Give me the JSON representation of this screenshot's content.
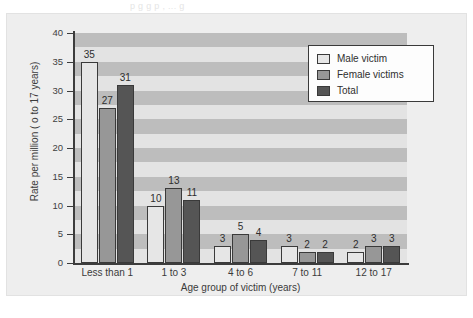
{
  "page": {
    "top_text_fragment": "p      g  g   p                 , ...  g",
    "background_color": "#eeeeee",
    "panel_color": "#eeeeee"
  },
  "chart_data": {
    "type": "bar",
    "title": "",
    "xlabel": "Age group of victim (years)",
    "ylabel": "Rate per million ( o to 17 years)",
    "categories": [
      "Less than 1",
      "1 to 3",
      "4 to 6",
      "7 to 11",
      "12 to 17"
    ],
    "series": [
      {
        "name": "Male victim",
        "color": "#e6e6e6",
        "values": [
          35,
          10,
          3,
          3,
          2
        ]
      },
      {
        "name": "Female victims",
        "color": "#979797",
        "values": [
          27,
          13,
          5,
          2,
          3
        ]
      },
      {
        "name": "Total",
        "color": "#555555",
        "values": [
          31,
          11,
          4,
          2,
          3
        ]
      }
    ],
    "ylim": [
      0,
      40
    ],
    "ytick_step": 5,
    "yticks": [
      0,
      5,
      10,
      15,
      20,
      25,
      30,
      35,
      40
    ],
    "ytick_labels": [
      "0",
      "5",
      "10",
      "15",
      "20",
      "25",
      "30",
      "35",
      "40"
    ],
    "grid": "horizontal-alternating-bands",
    "grid_band_colors": [
      "#e3e3e3",
      "#bdbdbd"
    ],
    "legend_position": "top-right",
    "data_labels": true
  },
  "legend": {
    "entries": [
      {
        "label": "Male victim",
        "swatch_class": "male"
      },
      {
        "label": "Female victims",
        "swatch_class": "female"
      },
      {
        "label": "Total",
        "swatch_class": "total"
      }
    ]
  }
}
